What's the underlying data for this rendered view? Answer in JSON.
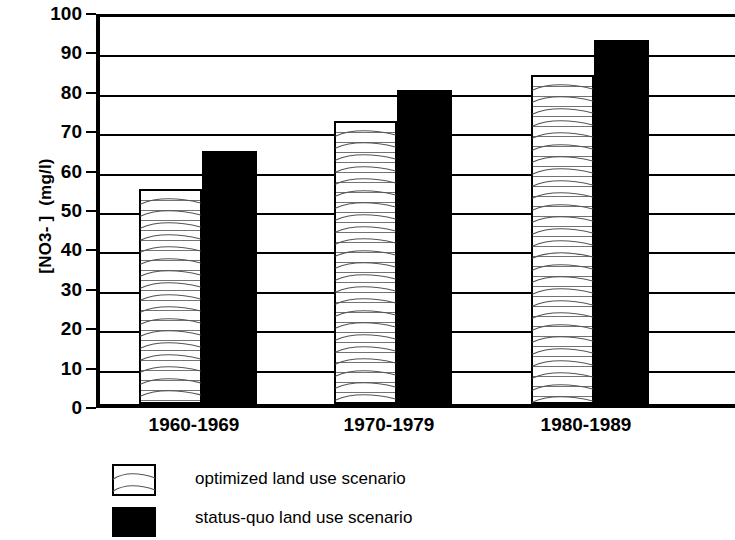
{
  "chart_data": {
    "type": "bar",
    "title": "",
    "subtitle": "",
    "xlabel": "",
    "ylabel": "[NO3- ]  (mg/l)",
    "categories": [
      "1960-1969",
      "1970-1979",
      "1980-1989"
    ],
    "series": [
      {
        "name": "optimized land use scenario",
        "values": [
          54.5,
          71.8,
          83.5
        ],
        "color": "#ffffff",
        "pattern": "wavy-horizontal-lines",
        "border_color": "#000000"
      },
      {
        "name": "status-quo land use scenario",
        "values": [
          64.3,
          79.7,
          92.3
        ],
        "color": "#000000",
        "pattern": "solid",
        "border_color": "#000000"
      }
    ],
    "ylim": [
      0,
      100
    ],
    "yticks": [
      0,
      10,
      20,
      30,
      40,
      50,
      60,
      70,
      80,
      90,
      100
    ],
    "ytick_labels": [
      "0",
      "10",
      "20",
      "30",
      "40",
      "50",
      "60",
      "70",
      "80",
      "90",
      "100"
    ],
    "grid": "horizontal",
    "legend_position": "bottom-left",
    "axis_color": "#000000",
    "background_color": "#ffffff"
  },
  "legend": {
    "entries": [
      {
        "label": "optimized land use scenario",
        "swatch": "optimized"
      },
      {
        "label": "status-quo land use scenario",
        "swatch": "statusquo"
      }
    ]
  }
}
